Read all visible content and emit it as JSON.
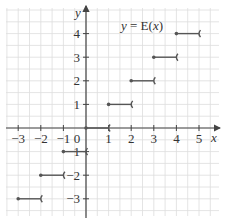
{
  "chart_data": {
    "type": "line",
    "title": "y = E(x)",
    "title_parts": {
      "y": "y",
      "eq": " = E(",
      "x": "x",
      "close": ")"
    },
    "xlabel": "x",
    "ylabel": "y",
    "xlim": [
      -3.5,
      5.5
    ],
    "ylim": [
      -3.5,
      4.5
    ],
    "grid": true,
    "x_ticks": [
      "-3",
      "-2",
      "-1",
      "0",
      "1",
      "2",
      "3",
      "4",
      "5"
    ],
    "y_ticks": [
      "4",
      "3",
      "2",
      "1",
      "-1",
      "-2",
      "-3"
    ],
    "segments": [
      {
        "x_start": -3,
        "x_end": -2,
        "y": -3,
        "start_closed": true,
        "end_open": true
      },
      {
        "x_start": -2,
        "x_end": -1,
        "y": -2,
        "start_closed": true,
        "end_open": true
      },
      {
        "x_start": -1,
        "x_end": 0,
        "y": -1,
        "start_closed": true,
        "end_open": true
      },
      {
        "x_start": 0,
        "x_end": 1,
        "y": 0,
        "start_closed": true,
        "end_open": true
      },
      {
        "x_start": 1,
        "x_end": 2,
        "y": 1,
        "start_closed": true,
        "end_open": true
      },
      {
        "x_start": 2,
        "x_end": 3,
        "y": 2,
        "start_closed": true,
        "end_open": true
      },
      {
        "x_start": 3,
        "x_end": 4,
        "y": 3,
        "start_closed": true,
        "end_open": true
      },
      {
        "x_start": 4,
        "x_end": 5,
        "y": 4,
        "start_closed": true,
        "end_open": true
      }
    ],
    "colors": {
      "segment": "#555555",
      "axis": "#444444",
      "grid": "#dddddd",
      "bg": "#ffffff"
    }
  }
}
